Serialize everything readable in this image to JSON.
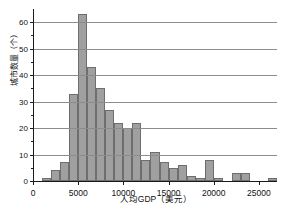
{
  "chart_data": {
    "type": "bar",
    "title": "",
    "subtitle": "",
    "xlabel": "人均GDP（美元）",
    "ylabel": "城市数量（个）",
    "xlim": [
      0,
      27000
    ],
    "ylim": [
      0,
      65
    ],
    "grid": true,
    "legend": null,
    "bin_width": 1000,
    "xticks": [
      0,
      5000,
      10000,
      15000,
      20000,
      25000
    ],
    "xtick_labels": [
      "0",
      "5000",
      "10000",
      "15000",
      "20000",
      "25000"
    ],
    "yticks": [
      0,
      10,
      20,
      30,
      40,
      50,
      60
    ],
    "ytick_labels": [
      "0",
      "10",
      "20",
      "30",
      "40",
      "50",
      "60"
    ],
    "bin_starts": [
      1000,
      2000,
      3000,
      4000,
      5000,
      6000,
      7000,
      8000,
      9000,
      10000,
      11000,
      12000,
      13000,
      14000,
      15000,
      16000,
      17000,
      18000,
      19000,
      20000,
      21000,
      22000,
      23000,
      24000,
      25000,
      26000
    ],
    "categories": [
      "1000-2000",
      "2000-3000",
      "3000-4000",
      "4000-5000",
      "5000-6000",
      "6000-7000",
      "7000-8000",
      "8000-9000",
      "9000-10000",
      "10000-11000",
      "11000-12000",
      "12000-13000",
      "13000-14000",
      "14000-15000",
      "15000-16000",
      "16000-17000",
      "17000-18000",
      "18000-19000",
      "19000-20000",
      "20000-21000",
      "21000-22000",
      "22000-23000",
      "23000-24000",
      "24000-25000",
      "25000-26000",
      "26000-27000"
    ],
    "values": [
      1,
      4,
      7,
      33,
      63,
      43,
      35,
      27,
      22,
      20,
      22,
      8,
      11,
      7,
      5,
      6,
      2,
      1,
      8,
      1,
      0,
      3,
      3,
      0,
      0,
      1
    ],
    "colors": {
      "bar_fill": "#a0a0a0",
      "bar_edge": "#6e6e6e",
      "gridline": "#8c8c8c",
      "axis": "#1a1a1a",
      "text": "#111111",
      "background": "#ffffff"
    }
  }
}
